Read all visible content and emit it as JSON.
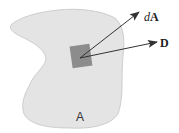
{
  "diagram": {
    "region_label": "A",
    "area_vector_label_italic": "d",
    "area_vector_label_bold": "A",
    "field_vector_label": "D",
    "colors": {
      "region_fill": "#e4e4e4",
      "region_stroke": "#c4c4c4",
      "patch_fill": "#8c8c8c",
      "arrow": "#333333",
      "background": "#ffffff"
    }
  }
}
